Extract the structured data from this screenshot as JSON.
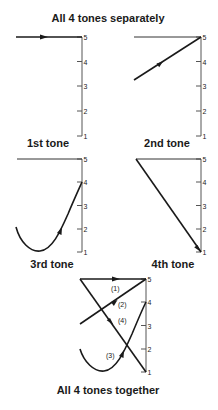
{
  "titles": {
    "top": "All 4 tones separately",
    "bottom": "All 4 tones together"
  },
  "scale": {
    "ticks": [
      "5",
      "4",
      "3",
      "2",
      "1"
    ]
  },
  "panels": [
    {
      "id": "tone1",
      "label": "1st tone",
      "contour": "high level",
      "start": 5,
      "end": 5
    },
    {
      "id": "tone2",
      "label": "2nd tone",
      "contour": "rising",
      "start": 3,
      "end": 5
    },
    {
      "id": "tone3",
      "label": "3rd tone",
      "contour": "dipping-rising",
      "start": 2,
      "low": 1,
      "end": 4
    },
    {
      "id": "tone4",
      "label": "4th tone",
      "contour": "falling",
      "start": 5,
      "end": 1
    }
  ],
  "combined": {
    "labels": [
      "(1)",
      "(2)",
      "(3)",
      "(4)"
    ]
  },
  "colors": {
    "ink": "#1a1a1a",
    "axis": "#555555",
    "background": "#ffffff"
  }
}
